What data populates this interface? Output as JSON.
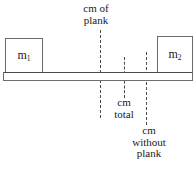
{
  "diagram": {
    "masses": [
      {
        "name": "mass-left",
        "label": "m",
        "subscript": "1"
      },
      {
        "name": "mass-right",
        "label": "m",
        "subscript": "2"
      }
    ],
    "annotations": [
      {
        "name": "cm-of-plank",
        "line1": "cm of",
        "line2": "plank",
        "line3": ""
      },
      {
        "name": "cm-total",
        "line1": "cm",
        "line2": "total",
        "line3": ""
      },
      {
        "name": "cm-without-plank",
        "line1": "cm",
        "line2": "without",
        "line3": "plank"
      }
    ],
    "colors": {
      "background": "#ffffff",
      "stroke": "#6b6b6b",
      "dashed": "#4a4a4a",
      "text": "#1a1a1a"
    }
  }
}
